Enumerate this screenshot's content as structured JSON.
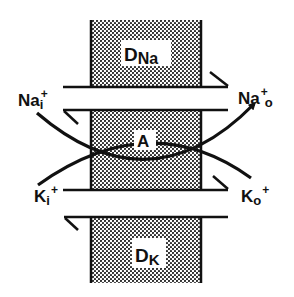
{
  "diagram": {
    "colors": {
      "ink": "#111111",
      "background": "#ffffff",
      "stipple": "#222222"
    },
    "membrane": {
      "upper_label": {
        "main": "D",
        "sub": "Na"
      },
      "middle_label": "A",
      "lower_label": {
        "main": "D",
        "sub": "K"
      }
    },
    "ions": {
      "na_in": {
        "main": "Na",
        "sup": "+",
        "sub": "i"
      },
      "na_out": {
        "main": "Na",
        "sup": "+",
        "sub": "o"
      },
      "k_in": {
        "main": "K",
        "sub": "i",
        "sup": "+"
      },
      "k_out": {
        "main": "K",
        "sub": "o",
        "sup": "+"
      }
    }
  }
}
